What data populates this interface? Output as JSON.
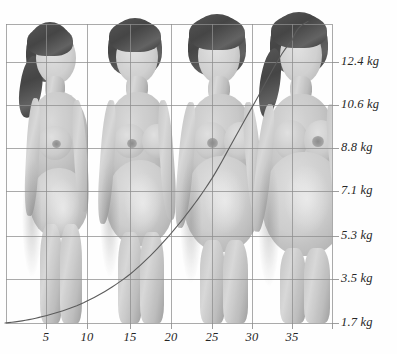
{
  "chart_data": {
    "type": "line",
    "title": "",
    "subtitle": "",
    "xlabel": "",
    "ylabel": "",
    "xlim": [
      0,
      40
    ],
    "ylim": [
      0,
      13.3
    ],
    "grid": true,
    "legend": null,
    "x_tick_labels": [
      "5",
      "10",
      "15",
      "20",
      "25",
      "30",
      "35"
    ],
    "x_tick_values": [
      5,
      10,
      15,
      20,
      25,
      30,
      35
    ],
    "y_tick_labels": [
      "1.7 kg",
      "3.5 kg",
      "5.3 kg",
      "7.1 kg",
      "8.8 kg",
      "10.6 kg",
      "12.4 kg"
    ],
    "y_tick_values": [
      1.7,
      3.5,
      5.3,
      7.1,
      8.8,
      10.6,
      12.4
    ],
    "series": [
      {
        "name": "weight gain",
        "x": [
          0,
          5,
          10,
          15,
          20,
          25,
          30,
          35,
          37
        ],
        "values": [
          0.0,
          0.3,
          0.9,
          2.0,
          3.7,
          5.9,
          8.8,
          11.6,
          12.4
        ]
      }
    ],
    "background_images": {
      "count": 4,
      "description": "four photographs of the same pregnant woman at successive stages of pregnancy",
      "approx_x_positions": [
        9,
        24,
        31,
        35
      ]
    }
  },
  "axis": {
    "y_unit": "kg",
    "x_unit": "weeks"
  },
  "colors": {
    "grid": "#8d8d8d",
    "curve": "#5b5b5b",
    "text": "#262626",
    "background": "#fefefe"
  }
}
